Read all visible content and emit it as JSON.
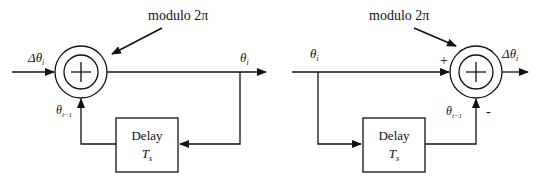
{
  "left_diagram": {
    "modulo_label": "modulo 2π",
    "input_label": "Δθ",
    "input_sub": "i",
    "output_label": "θ",
    "output_sub": "i",
    "feedback_label": "θ",
    "feedback_sub": "i−1",
    "delay_line1": "Delay",
    "delay_line2": "T",
    "delay_sub": "s"
  },
  "right_diagram": {
    "modulo_label": "modulo 2π",
    "input_label": "θ",
    "input_sub": "i",
    "output_label": "Δθ",
    "output_sub": "i",
    "feedback_label": "θ",
    "feedback_sub": "i−1",
    "plus_sign": "+",
    "minus_sign": "-",
    "delay_line1": "Delay",
    "delay_line2": "T",
    "delay_sub": "s"
  }
}
